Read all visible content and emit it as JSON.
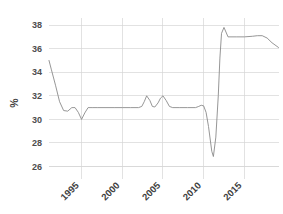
{
  "chart_data": {
    "type": "line",
    "title": "",
    "subtitle": "",
    "xlabel": "",
    "ylabel": "%",
    "xlim": [
      1991.0,
      2019.2
    ],
    "ylim": [
      25.2,
      38.6
    ],
    "grid": true,
    "legend": false,
    "legend_position": "none",
    "line_color": "#8a8a8a",
    "grid_color": "#d6d6d6",
    "background_color": "#ffffff",
    "ytick_labels": [
      "26",
      "28",
      "30",
      "32",
      "34",
      "36",
      "38"
    ],
    "ytick_values": [
      26,
      28,
      30,
      32,
      34,
      36,
      38
    ],
    "xtick_labels": [
      "1995",
      "2000",
      "2005",
      "2010",
      "2015"
    ],
    "xtick_values": [
      1995,
      2000,
      2005,
      2010,
      2015
    ],
    "xtick_rotation": 45,
    "series": [
      {
        "name": "%",
        "x": [
          1991.0,
          1991.3,
          1991.8,
          1992.3,
          1992.8,
          1993.3,
          1993.8,
          1994.2,
          1994.6,
          1995.0,
          1995.4,
          1995.8,
          1996.3,
          1997.0,
          1998.0,
          1999.0,
          2000.0,
          2001.0,
          2002.0,
          2002.4,
          2002.7,
          2003.0,
          2003.4,
          2003.7,
          2004.0,
          2004.4,
          2004.7,
          2005.0,
          2005.4,
          2005.8,
          2006.2,
          2007.0,
          2008.0,
          2009.0,
          2009.4,
          2009.7,
          2010.0,
          2010.3,
          2010.6,
          2011.0,
          2011.2,
          2011.5,
          2011.8,
          2012.0,
          2012.2,
          2012.5,
          2013.0,
          2014.0,
          2015.0,
          2016.0,
          2016.6,
          2017.2,
          2017.8,
          2018.4,
          2019.2
        ],
        "y": [
          35.0,
          34.2,
          32.9,
          31.5,
          30.75,
          30.7,
          31.0,
          31.0,
          30.6,
          30.0,
          30.55,
          31.0,
          31.0,
          31.0,
          31.0,
          31.0,
          31.0,
          31.0,
          31.0,
          31.1,
          31.5,
          32.0,
          31.6,
          31.1,
          31.05,
          31.4,
          31.8,
          32.0,
          31.6,
          31.1,
          31.0,
          31.0,
          31.0,
          31.0,
          31.1,
          31.2,
          31.15,
          30.6,
          29.4,
          27.3,
          26.85,
          28.5,
          32.0,
          35.2,
          37.3,
          37.8,
          37.0,
          37.0,
          37.0,
          37.05,
          37.1,
          37.1,
          36.9,
          36.5,
          36.1
        ]
      }
    ]
  }
}
